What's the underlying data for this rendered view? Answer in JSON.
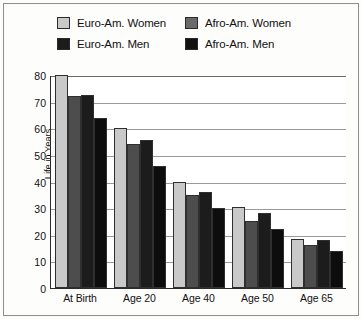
{
  "chart_data": {
    "type": "bar",
    "title": "",
    "xlabel": "",
    "ylabel": "Life in Years",
    "ylim": [
      0,
      80
    ],
    "yticks": [
      80,
      70,
      60,
      50,
      40,
      30,
      20,
      10,
      0
    ],
    "grid": true,
    "legend_position": "top",
    "categories": [
      "At Birth",
      "Age 20",
      "Age 40",
      "Age 50",
      "Age 65"
    ],
    "series": [
      {
        "name": "Euro-Am. Women",
        "color": "#c9c9c9",
        "values": [
          80,
          60,
          40,
          30.5,
          18.5
        ]
      },
      {
        "name": "Euro-Am. Men",
        "color": "#1c1c1c",
        "values": [
          72.5,
          55.5,
          36,
          28,
          18
        ]
      },
      {
        "name": "Afro-Am. Women",
        "color": "#4d4d4d",
        "values": [
          72,
          54,
          35,
          25,
          16
        ]
      },
      {
        "name": "Afro-Am. Men",
        "color": "#0d0d0d",
        "values": [
          64,
          46,
          30,
          22,
          14
        ]
      }
    ],
    "bar_order": [
      "Euro-Am. Women",
      "Afro-Am. Women",
      "Euro-Am. Men",
      "Afro-Am. Men"
    ]
  },
  "legend": {
    "items": [
      {
        "label": "Euro-Am. Women",
        "color": "#c9c9c9"
      },
      {
        "label": "Afro-Am. Women",
        "color": "#6a6a6a"
      },
      {
        "label": "Euro-Am. Men",
        "color": "#1c1c1c"
      },
      {
        "label": "Afro-Am. Men",
        "color": "#111111"
      }
    ]
  },
  "axis": {
    "y_title": "Life in Years",
    "y_ticks": [
      "80",
      "70",
      "60",
      "50",
      "40",
      "30",
      "20",
      "10",
      "0"
    ],
    "x_ticks": [
      "At Birth",
      "Age 20",
      "Age 40",
      "Age 50",
      "Age 65"
    ]
  },
  "colors": {
    "frame": "#8d8d8d",
    "axis": "#2b2b2b",
    "grid": "#9a9a9a",
    "background": "#fdfdfc"
  }
}
